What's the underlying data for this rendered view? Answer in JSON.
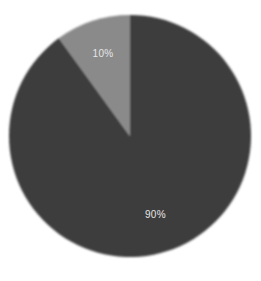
{
  "chart_data": {
    "type": "pie",
    "title": "",
    "categories": [
      "Slice A",
      "Slice B"
    ],
    "values": [
      90,
      10
    ],
    "labels": [
      "90%",
      "10%"
    ],
    "colors": [
      "#3e3e3e",
      "#8a8a8a"
    ],
    "start_angle_deg": 0,
    "direction": "clockwise",
    "legend": "none",
    "label_color": "#e6e6e6"
  },
  "geometry": {
    "cx": 130,
    "cy": 136,
    "r": 121
  }
}
